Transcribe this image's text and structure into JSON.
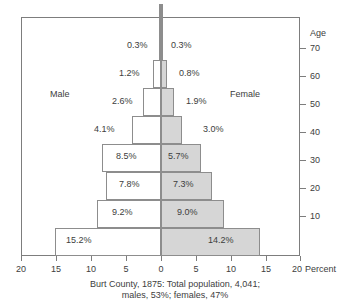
{
  "chart_data": {
    "type": "bar",
    "subtype": "population-pyramid",
    "title": "",
    "xlabel": "Percent",
    "ylabel": "Age",
    "xlim": [
      -20,
      20
    ],
    "xtick_labels": [
      "20",
      "15",
      "10",
      "5",
      "0",
      "5",
      "10",
      "15",
      "20"
    ],
    "xtick_values": [
      -20,
      -15,
      -10,
      -5,
      0,
      5,
      10,
      15,
      20
    ],
    "ytick_labels": [
      "70",
      "60",
      "50",
      "40",
      "30",
      "20",
      "10"
    ],
    "ytick_values": [
      70,
      60,
      50,
      40,
      30,
      20,
      10
    ],
    "grid": false,
    "legend_position": "inline",
    "categories": [
      "0-9",
      "10-19",
      "20-29",
      "30-39",
      "40-49",
      "50-59",
      "60-69",
      "70-79",
      "80+"
    ],
    "series": [
      {
        "name": "Male",
        "values": [
          15.2,
          9.2,
          7.8,
          8.5,
          4.1,
          2.6,
          1.2,
          0.3,
          0.3
        ]
      },
      {
        "name": "Female",
        "values": [
          14.2,
          9.0,
          7.3,
          5.7,
          3.0,
          1.9,
          0.8,
          0.3,
          0.3
        ]
      }
    ],
    "male_labels": [
      "15.2%",
      "9.2%",
      "7.8%",
      "8.5%",
      "4.1%",
      "2.6%",
      "1.2%",
      "0.3%",
      ""
    ],
    "female_labels": [
      "14.2%",
      "9.0%",
      "7.3%",
      "5.7%",
      "3.0%",
      "1.9%",
      "0.8%",
      "0.3%",
      ""
    ],
    "annotations": [
      "Burt County, 1875: Total population, 4,041;",
      "males, 53%; females, 47%"
    ],
    "colors": {
      "male_fill": "#ffffff",
      "female_fill": "#d6d6d6",
      "outline": "#8d8d8d",
      "axis": "#7d7d7d",
      "text": "#3d3d3d"
    }
  },
  "axes": {
    "age_title": "Age",
    "percent_unit": "Percent"
  },
  "legend": {
    "male": "Male",
    "female": "Female"
  },
  "caption": {
    "line1": "Burt County, 1875: Total population, 4,041;",
    "line2": "males, 53%; females, 47%"
  }
}
